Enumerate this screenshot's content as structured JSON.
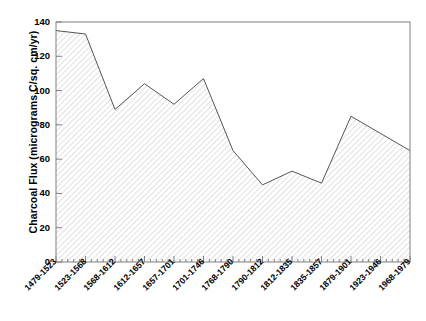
{
  "chart_data": {
    "type": "area",
    "title": "",
    "xlabel": "",
    "ylabel": "Charcoal Flux (micrograms C/sq. cm/yr)",
    "categories": [
      "1479-1523",
      "1523-1568",
      "1568-1612",
      "1612-1657",
      "1657-1701",
      "1701-1746",
      "1768-1790",
      "1790-1812",
      "1812-1835",
      "1835-1857",
      "1879-1901",
      "1923-1946",
      "1968-1979"
    ],
    "values": [
      135,
      133,
      89,
      104,
      92,
      107,
      65,
      45,
      53,
      46,
      85,
      75,
      65
    ],
    "ylim": [
      0,
      140
    ],
    "ytick_labels": [
      "0",
      "20",
      "40",
      "60",
      "80",
      "100",
      "120",
      "140"
    ],
    "ytick_values": [
      0,
      20,
      40,
      60,
      80,
      100,
      120,
      140
    ],
    "grid": false,
    "legend": "none",
    "fill_style": "diagonal-hatch",
    "line_color": "#555555",
    "hatch_color": "#bbbbbb",
    "axis_color": "#808080",
    "minor_ticks_per_interval": 4
  }
}
